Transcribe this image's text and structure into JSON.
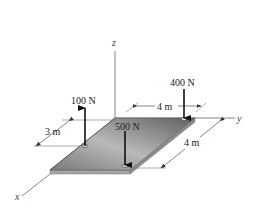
{
  "axes": {
    "x_label": "x",
    "y_label": "y",
    "z_label": "z"
  },
  "forces": [
    {
      "label": "100 N",
      "direction": "up"
    },
    {
      "label": "500 N",
      "direction": "down"
    },
    {
      "label": "400 N",
      "direction": "down"
    }
  ],
  "dimensions": [
    {
      "label": "3 m"
    },
    {
      "label": "4 m"
    },
    {
      "label": "4 m"
    }
  ],
  "colors": {
    "plate_top_light": "#d8d8d8",
    "plate_top_dark": "#6e6e6e",
    "plate_edge": "#a9a9a9",
    "arrow": "#111111",
    "axis": "#555555"
  }
}
